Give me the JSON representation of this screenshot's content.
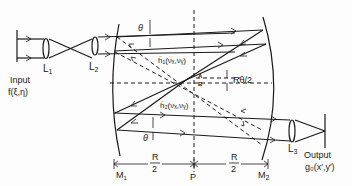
{
  "diagram": {
    "type": "optical-correlator-schematic",
    "colors": {
      "ink": "#1a1a1a",
      "background": "#fdfdfd"
    },
    "labels": {
      "input_title": "Input",
      "input_func": "f(ξ,η)",
      "lens1": "L",
      "lens1_sub": "1",
      "lens2": "L",
      "lens2_sub": "2",
      "lens3": "L",
      "lens3_sub": "3",
      "theta_top": "θ",
      "theta_bottom": "θ",
      "h1": "ĥ₁(νₓ,νᵧ)",
      "h2": "ĥ₂(νₓ,νᵧ)",
      "point_a": "A",
      "point_b": "B",
      "r_theta": "Rθ/2",
      "output_title": "Output",
      "output_func": "g₀(x′,y′)",
      "mirror1": "M",
      "mirror1_sub": "1",
      "mirror2": "M",
      "mirror2_sub": "2",
      "center": "P",
      "dist_left_num": "R",
      "dist_left_den": "2",
      "dist_right_num": "R",
      "dist_right_den": "2"
    }
  }
}
